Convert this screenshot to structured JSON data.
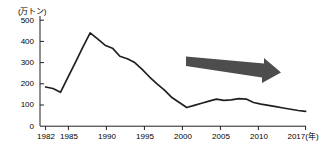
{
  "chart_data": {
    "type": "line",
    "title": "",
    "unit_label": "(万トン)",
    "xlabel": "(年)",
    "ylabel": "",
    "ylim": [
      0,
      500
    ],
    "xlim": [
      1982,
      2017
    ],
    "yticks": [
      0,
      100,
      200,
      300,
      400,
      500
    ],
    "ytick_labels": [
      "0",
      "100",
      "200",
      "300",
      "400",
      "500"
    ],
    "xticks": [
      1982,
      1985,
      1990,
      1995,
      2000,
      2005,
      2010,
      2017
    ],
    "xtick_labels": [
      "1982",
      "1985",
      "1990",
      "1995",
      "2000",
      "2005",
      "2010",
      "2017"
    ],
    "x_axis_end_label": "2017(年)",
    "grid": false,
    "legend": false,
    "line_color": "#231f20",
    "x": [
      1982,
      1983,
      1984,
      1985,
      1986,
      1987,
      1988,
      1989,
      1990,
      1991,
      1992,
      1993,
      1994,
      1995,
      1996,
      1997,
      1998,
      1999,
      2000,
      2001,
      2002,
      2003,
      2004,
      2005,
      2006,
      2007,
      2008,
      2009,
      2010,
      2011,
      2012,
      2013,
      2014,
      2015,
      2016,
      2017
    ],
    "values": [
      185,
      178,
      160,
      230,
      300,
      372,
      440,
      412,
      382,
      368,
      330,
      318,
      300,
      268,
      232,
      200,
      170,
      135,
      112,
      88,
      98,
      108,
      118,
      128,
      122,
      124,
      130,
      128,
      112,
      104,
      98,
      92,
      86,
      80,
      74,
      70
    ],
    "series": [
      {
        "name": "",
        "values": [
          185,
          178,
          160,
          230,
          300,
          372,
          440,
          412,
          382,
          368,
          330,
          318,
          300,
          268,
          232,
          200,
          170,
          135,
          112,
          88,
          98,
          108,
          118,
          128,
          122,
          124,
          130,
          128,
          112,
          104,
          98,
          92,
          86,
          80,
          74,
          70
        ]
      }
    ],
    "annotations": [
      {
        "type": "arrow",
        "name": "trend-arrow",
        "direction": "right-down",
        "color": "#4d4d4d",
        "from_x": 2000,
        "from_y": 330,
        "to_x": 2013,
        "to_y": 275
      }
    ]
  }
}
